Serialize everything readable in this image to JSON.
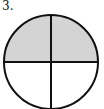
{
  "problem": {
    "number_label": "3."
  },
  "figure": {
    "type": "circle divided into 4 equal parts",
    "total_parts": 4,
    "shaded_parts": 2,
    "shaded_region": "top half",
    "colors": {
      "shade": "#d4d4d4",
      "stroke": "#111111",
      "background": "#ffffff"
    }
  }
}
